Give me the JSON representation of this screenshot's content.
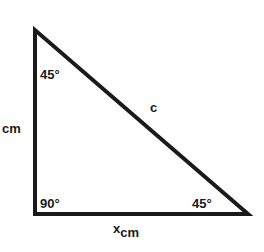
{
  "diagram": {
    "type": "right-triangle",
    "stroke_color": "#1a1a1a",
    "vertices": {
      "top": [
        35,
        30
      ],
      "bottom_left": [
        35,
        214
      ],
      "bottom_right": [
        248,
        214
      ]
    },
    "labels": {
      "angle_top": "45°",
      "angle_right": "90°",
      "angle_bottom_right": "45°",
      "hypotenuse": "c",
      "left_side_unit": "cm",
      "bottom_side_var": "x",
      "bottom_side_unit": "cm"
    }
  }
}
